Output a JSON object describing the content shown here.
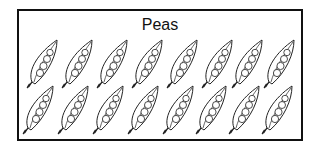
{
  "title": "Peas",
  "picture": {
    "item": "pea pod",
    "rows": 2,
    "per_row": 8,
    "total": 16
  },
  "colors": {
    "stroke": "#222222",
    "border": "#111111",
    "background": "#ffffff"
  },
  "icons": [
    "pea-pod-icon"
  ]
}
